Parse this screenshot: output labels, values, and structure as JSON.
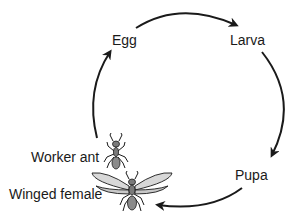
{
  "diagram": {
    "stages": [
      {
        "id": "egg",
        "label": "Egg"
      },
      {
        "id": "larva",
        "label": "Larva"
      },
      {
        "id": "pupa",
        "label": "Pupa"
      },
      {
        "id": "worker",
        "label": "Worker ant"
      },
      {
        "id": "winged",
        "label": "Winged female"
      }
    ],
    "arrows": [
      {
        "from": "egg",
        "to": "larva"
      },
      {
        "from": "larva",
        "to": "pupa"
      },
      {
        "from": "pupa",
        "to": "winged"
      },
      {
        "from": "worker",
        "to": "egg"
      }
    ],
    "colors": {
      "line": "#1a1a1a",
      "ant_body": "#7a7a7a",
      "wing": "#d8d8d8",
      "text": "#1a1a1a"
    }
  }
}
